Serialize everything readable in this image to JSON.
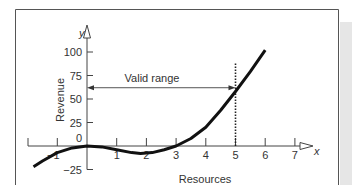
{
  "chart_data": {
    "type": "line",
    "title": "",
    "xlabel": "Resources",
    "ylabel": "Revenue",
    "x_axis_name": "x",
    "y_axis_name": "y",
    "xlim": [
      -1.9,
      7.5
    ],
    "ylim": [
      -25,
      112
    ],
    "x_ticks": [
      -1,
      1,
      2,
      3,
      4,
      5,
      6,
      7
    ],
    "x_tick_labels": [
      "−1",
      "1",
      "2",
      "3",
      "4",
      "5",
      "6",
      "7"
    ],
    "y_ticks": [
      -25,
      0,
      25,
      50,
      75,
      100
    ],
    "y_tick_labels": [
      "−25",
      "0",
      "25",
      "50",
      "75",
      "100"
    ],
    "grid": false,
    "legend": null,
    "series": [
      {
        "name": "Revenue curve",
        "x": [
          -1.8,
          -1.5,
          -1.0,
          -0.5,
          0,
          0.5,
          1.0,
          1.5,
          1.8,
          2.2,
          2.6,
          3.0,
          3.5,
          4.0,
          4.5,
          5.0,
          5.5,
          6.0
        ],
        "y": [
          -22,
          -16,
          -7,
          -2,
          0,
          -1,
          -4,
          -7,
          -8,
          -7,
          -4,
          0,
          8,
          20,
          38,
          58,
          79,
          102
        ]
      }
    ],
    "annotations": [
      {
        "type": "double-arrow",
        "label": "Valid range",
        "x_from": 0,
        "x_to": 5,
        "y": 62
      },
      {
        "type": "dotted-vline",
        "x": 5,
        "y_from": 0,
        "y_to": 88
      }
    ]
  },
  "labels": {
    "valid_range": "Valid range",
    "xlabel": "Resources",
    "ylabel": "Revenue",
    "x_axis_name": "x",
    "y_axis_name": "y"
  }
}
